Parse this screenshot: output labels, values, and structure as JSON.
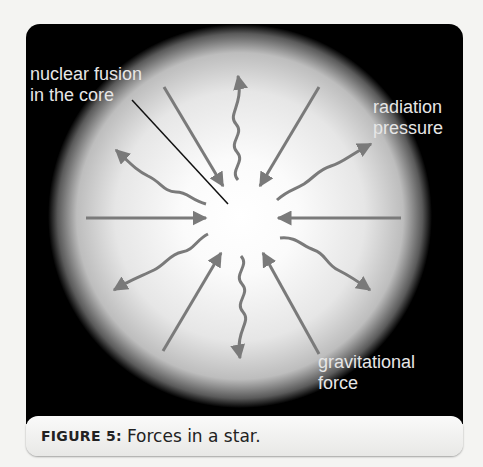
{
  "figure": {
    "labels": {
      "fusion_line1": "nuclear fusion",
      "fusion_line2": "in the core",
      "radiation_line1": "radiation",
      "radiation_line2": "pressure",
      "gravity_line1": "gravitational",
      "gravity_line2": "force"
    },
    "caption": {
      "prefix": "FIGURE 5:",
      "text": "Forces in a star."
    },
    "colors": {
      "background": "#000000",
      "arrow": "#7a7a7a",
      "label_text": "#e6e6e6",
      "star_core": "#ffffff"
    }
  }
}
